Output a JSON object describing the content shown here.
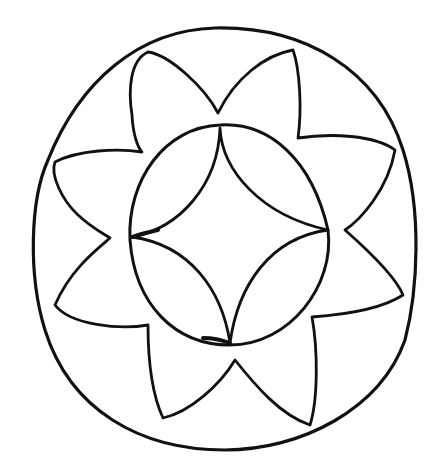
{
  "drawing": {
    "title": "Hand-drawn eight-petal mandala line art",
    "ink_color": "#111111",
    "background_color": "#ffffff",
    "outer_circle": {
      "cx": 223,
      "cy": 238,
      "rx": 192,
      "ry": 210
    },
    "inner_circle": {
      "cx": 229,
      "cy": 235,
      "rx": 101,
      "ry": 111
    },
    "petal_count": 8,
    "inner_star_points": 4
  }
}
